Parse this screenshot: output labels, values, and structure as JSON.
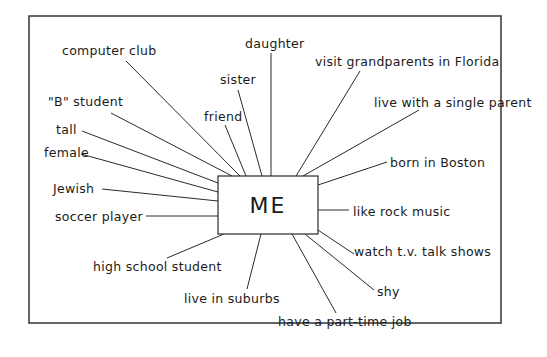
{
  "diagram": {
    "center": {
      "label": "ME",
      "x": 218,
      "y": 176,
      "w": 100,
      "h": 58
    },
    "frame": {
      "x": 29,
      "y": 16,
      "w": 472,
      "h": 307
    },
    "colors": {
      "ink": "#1a1a1a",
      "background": "#ffffff"
    },
    "nodes": [
      {
        "id": "computer-club",
        "label": "computer club",
        "tx": 62,
        "ty": 55,
        "x1": 126,
        "y1": 61,
        "x2": 240,
        "y2": 176
      },
      {
        "id": "daughter",
        "label": "daughter",
        "tx": 245,
        "ty": 48,
        "x1": 271,
        "y1": 53,
        "x2": 271,
        "y2": 176
      },
      {
        "id": "sister",
        "label": "sister",
        "tx": 220,
        "ty": 84,
        "x1": 238,
        "y1": 90,
        "x2": 262,
        "y2": 176
      },
      {
        "id": "friend",
        "label": "friend",
        "tx": 204,
        "ty": 121,
        "x1": 225,
        "y1": 125,
        "x2": 246,
        "y2": 176
      },
      {
        "id": "b-student",
        "label": "\"B\" student",
        "tx": 48,
        "ty": 106,
        "x1": 111,
        "y1": 113,
        "x2": 232,
        "y2": 176
      },
      {
        "id": "tall",
        "label": "tall",
        "tx": 56,
        "ty": 134,
        "x1": 82,
        "y1": 131,
        "x2": 218,
        "y2": 183
      },
      {
        "id": "female",
        "label": "female",
        "tx": 44,
        "ty": 157,
        "x1": 81,
        "y1": 154,
        "x2": 218,
        "y2": 192
      },
      {
        "id": "jewish",
        "label": "Jewish",
        "tx": 53,
        "ty": 193,
        "x1": 102,
        "y1": 189,
        "x2": 218,
        "y2": 201
      },
      {
        "id": "soccer-player",
        "label": "soccer player",
        "tx": 55,
        "ty": 221,
        "x1": 146,
        "y1": 216,
        "x2": 218,
        "y2": 216
      },
      {
        "id": "high-school-student",
        "label": "high school student",
        "tx": 93,
        "ty": 271,
        "x1": 167,
        "y1": 258,
        "x2": 224,
        "y2": 234
      },
      {
        "id": "live-in-suburbs",
        "label": "live in suburbs",
        "tx": 184,
        "ty": 303,
        "x1": 247,
        "y1": 289,
        "x2": 261,
        "y2": 234
      },
      {
        "id": "have-part-time-job",
        "label": "have a part-time job",
        "tx": 278,
        "ty": 326,
        "x1": 336,
        "y1": 313,
        "x2": 292,
        "y2": 234
      },
      {
        "id": "shy",
        "label": "shy",
        "tx": 377,
        "ty": 296,
        "x1": 374,
        "y1": 290,
        "x2": 305,
        "y2": 234
      },
      {
        "id": "watch-tv-talk-shows",
        "label": "watch t.v. talk shows",
        "tx": 354,
        "ty": 256,
        "x1": 354,
        "y1": 254,
        "x2": 318,
        "y2": 230
      },
      {
        "id": "like-rock-music",
        "label": "like rock music",
        "tx": 353,
        "ty": 216,
        "x1": 349,
        "y1": 210,
        "x2": 318,
        "y2": 210
      },
      {
        "id": "born-in-boston",
        "label": "born in Boston",
        "tx": 390,
        "ty": 167,
        "x1": 387,
        "y1": 162,
        "x2": 318,
        "y2": 185
      },
      {
        "id": "live-with-single-parent",
        "label": "live with a single parent",
        "tx": 374,
        "ty": 107,
        "x1": 419,
        "y1": 110,
        "x2": 303,
        "y2": 176
      },
      {
        "id": "visit-grandparents-florida",
        "label": "visit grandparents in Florida",
        "tx": 315,
        "ty": 66,
        "x1": 360,
        "y1": 71,
        "x2": 296,
        "y2": 176
      }
    ]
  }
}
